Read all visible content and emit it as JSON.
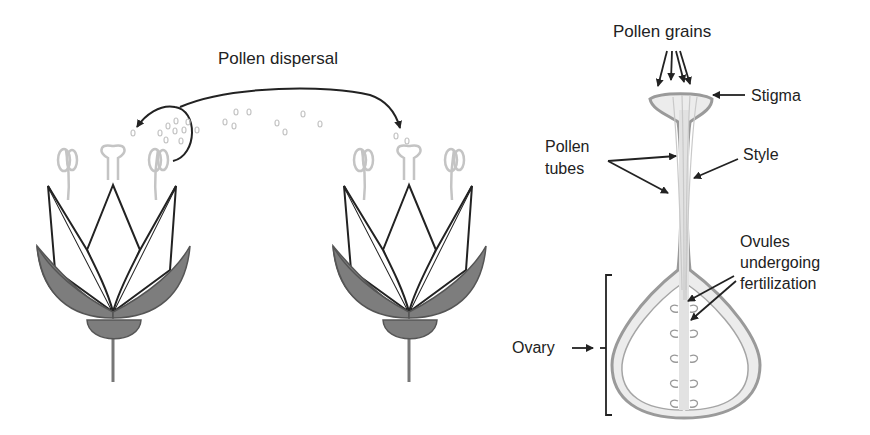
{
  "left_panel": {
    "title": "Pollen dispersal",
    "flowers": [
      "source-flower",
      "receiving-flower"
    ]
  },
  "right_panel": {
    "labels": {
      "pollen_grains": "Pollen grains",
      "stigma": "Stigma",
      "pollen_tubes_line1": "Pollen",
      "pollen_tubes_line2": "tubes",
      "style": "Style",
      "ovules_line1": "Ovules",
      "ovules_line2": "undergoing",
      "ovules_line3": "fertilization",
      "ovary": "Ovary"
    }
  },
  "colors": {
    "outline": "#222222",
    "sepal_fill": "#7d7d7d",
    "pale_structure": "#bdbdbd",
    "pistil_fill": "#e6e6e6"
  }
}
